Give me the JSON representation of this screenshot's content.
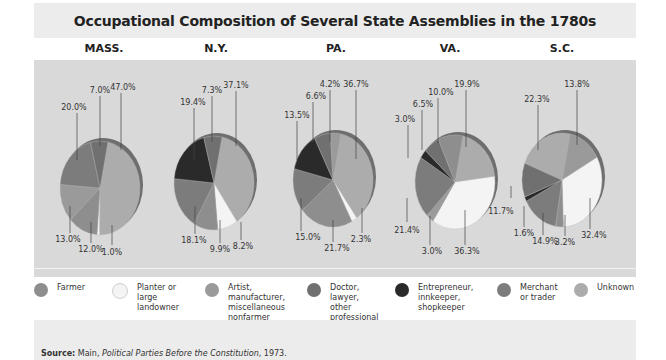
{
  "title": "Occupational Composition of Several State Assemblies in the 1780s",
  "source": {
    "label": "Source:",
    "author": "Main,",
    "work": "Political Parties Before the Constitution",
    "year": ", 1973."
  },
  "colors": {
    "Farmer": "#8e8e8e",
    "Planter": "#f4f4f4",
    "Artist": "#9a9a9a",
    "Doctor": "#707070",
    "Entrepreneur": "#2a2a2a",
    "Merchant": "#7c7c7c",
    "Unknown": "#acacac"
  },
  "legend": [
    {
      "key": "Farmer",
      "label": "Farmer"
    },
    {
      "key": "Planter",
      "label": "Planter or\nlarge\nlandowner"
    },
    {
      "key": "Artist",
      "label": "Artist,\nmanufacturer,\nmiscellaneous\nnonfarmer"
    },
    {
      "key": "Doctor",
      "label": "Doctor,\nlawyer,\nother\nprofessional"
    },
    {
      "key": "Entrepreneur",
      "label": "Entrepreneur,\ninnkeeper,\nshopkeeper"
    },
    {
      "key": "Merchant",
      "label": "Merchant\nor trader"
    },
    {
      "key": "Unknown",
      "label": "Unknown"
    }
  ],
  "chart_data": {
    "type": "pie",
    "title": "Occupational Composition of Several State Assemblies in the 1780s",
    "categories": [
      "Farmer",
      "Planter or large landowner",
      "Artist, manufacturer, miscellaneous nonfarmer",
      "Doctor, lawyer, other professional",
      "Entrepreneur, innkeeper, shopkeeper",
      "Merchant or trader",
      "Unknown"
    ],
    "legend_position": "bottom",
    "source": "Main, Political Parties Before the Constitution, 1973.",
    "pies": [
      {
        "state": "MASS.",
        "slices": [
          {
            "key": "Unknown",
            "value": 47.0
          },
          {
            "key": "Planter",
            "value": 1.0
          },
          {
            "key": "Farmer",
            "value": 12.0
          },
          {
            "key": "Artist",
            "value": 13.0
          },
          {
            "key": "Merchant",
            "value": 20.0
          },
          {
            "key": "Doctor",
            "value": 7.0
          }
        ]
      },
      {
        "state": "N.Y.",
        "slices": [
          {
            "key": "Unknown",
            "value": 37.1
          },
          {
            "key": "Planter",
            "value": 8.2
          },
          {
            "key": "Farmer",
            "value": 9.9
          },
          {
            "key": "Merchant",
            "value": 18.1
          },
          {
            "key": "Entrepreneur",
            "value": 19.4
          },
          {
            "key": "Doctor",
            "value": 7.3
          }
        ]
      },
      {
        "state": "PA.",
        "slices": [
          {
            "key": "Unknown",
            "value": 36.7
          },
          {
            "key": "Planter",
            "value": 2.3
          },
          {
            "key": "Farmer",
            "value": 21.7
          },
          {
            "key": "Merchant",
            "value": 15.0
          },
          {
            "key": "Entrepreneur",
            "value": 13.5
          },
          {
            "key": "Doctor",
            "value": 6.6
          },
          {
            "key": "Artist",
            "value": 4.2
          }
        ]
      },
      {
        "state": "VA.",
        "slices": [
          {
            "key": "Unknown",
            "value": 19.9
          },
          {
            "key": "Planter",
            "value": 36.3
          },
          {
            "key": "Artist",
            "value": 3.0
          },
          {
            "key": "Merchant",
            "value": 21.4
          },
          {
            "key": "Entrepreneur",
            "value": 3.0
          },
          {
            "key": "Doctor",
            "value": 6.5
          },
          {
            "key": "Farmer",
            "value": 10.0
          }
        ]
      },
      {
        "state": "S.C.",
        "slices": [
          {
            "key": "Artist",
            "value": 13.8
          },
          {
            "key": "Planter",
            "value": 32.4
          },
          {
            "key": "Farmer",
            "value": 3.2
          },
          {
            "key": "Merchant",
            "value": 14.9
          },
          {
            "key": "Entrepreneur",
            "value": 1.6
          },
          {
            "key": "Doctor",
            "value": 11.7
          },
          {
            "key": "Unknown",
            "value": 22.3
          }
        ]
      }
    ]
  },
  "layout": {
    "pies": [
      {
        "cx": 100,
        "cy": 188,
        "label_x": 97,
        "labels": [
          {
            "text": "47.0%",
            "x": 123,
            "y": 90,
            "lx": 121,
            "ly1": 93,
            "ly2": 150
          },
          {
            "text": "1.0%",
            "x": 112,
            "y": 255,
            "lx": 112,
            "ly1": 245,
            "ly2": 225
          },
          {
            "text": "12.0%",
            "x": 91,
            "y": 252,
            "lx": 91,
            "ly1": 243,
            "ly2": 222
          },
          {
            "text": "13.0%",
            "x": 68,
            "y": 242,
            "lx": 70,
            "ly1": 233,
            "ly2": 206
          },
          {
            "text": "20.0%",
            "x": 74,
            "y": 110,
            "lx": 77,
            "ly1": 113,
            "ly2": 160
          },
          {
            "text": "7.0%",
            "x": 100,
            "y": 93,
            "lx": 100,
            "ly1": 96,
            "ly2": 146
          }
        ]
      },
      {
        "cx": 214,
        "cy": 183,
        "labels": [
          {
            "text": "37.1%",
            "x": 236,
            "y": 88,
            "lx": 236,
            "ly1": 91,
            "ly2": 146
          },
          {
            "text": "8.2%",
            "x": 243,
            "y": 249,
            "lx": 241,
            "ly1": 240,
            "ly2": 222
          },
          {
            "text": "9.9%",
            "x": 220,
            "y": 252,
            "lx": 220,
            "ly1": 243,
            "ly2": 220
          },
          {
            "text": "18.1%",
            "x": 194,
            "y": 243,
            "lx": 195,
            "ly1": 234,
            "ly2": 206
          },
          {
            "text": "19.4%",
            "x": 193,
            "y": 105,
            "lx": 194,
            "ly1": 108,
            "ly2": 160
          },
          {
            "text": "7.3%",
            "x": 212,
            "y": 93,
            "lx": 212,
            "ly1": 96,
            "ly2": 142
          }
        ]
      },
      {
        "cx": 333,
        "cy": 180,
        "labels": [
          {
            "text": "36.7%",
            "x": 356,
            "y": 87,
            "lx": 356,
            "ly1": 90,
            "ly2": 159
          },
          {
            "text": "2.3%",
            "x": 361,
            "y": 242,
            "lx": 362,
            "ly1": 233,
            "ly2": 208
          },
          {
            "text": "21.7%",
            "x": 337,
            "y": 251,
            "lx": 333,
            "ly1": 242,
            "ly2": 220
          },
          {
            "text": "15.0%",
            "x": 308,
            "y": 240,
            "lx": 301,
            "ly1": 231,
            "ly2": 198
          },
          {
            "text": "13.5%",
            "x": 297,
            "y": 118,
            "lx": 297,
            "ly1": 121,
            "ly2": 160
          },
          {
            "text": "6.6%",
            "x": 316,
            "y": 99,
            "lx": 313,
            "ly1": 102,
            "ly2": 142
          },
          {
            "text": "4.2%",
            "x": 330,
            "y": 87,
            "lx": 330,
            "ly1": 90,
            "ly2": 142
          }
        ]
      },
      {
        "cx": 455,
        "cy": 182,
        "labels": [
          {
            "text": "19.9%",
            "x": 467,
            "y": 87,
            "lx": 466,
            "ly1": 90,
            "ly2": 147
          },
          {
            "text": "36.3%",
            "x": 467,
            "y": 254,
            "lx": 465,
            "ly1": 245,
            "ly2": 210
          },
          {
            "text": "3.0%",
            "x": 432,
            "y": 254,
            "lx": 430,
            "ly1": 245,
            "ly2": 216
          },
          {
            "text": "21.4%",
            "x": 407,
            "y": 233,
            "lx": 407,
            "ly1": 222,
            "ly2": 198
          },
          {
            "text": "3.0%",
            "x": 405,
            "y": 122,
            "lx": 408,
            "ly1": 125,
            "ly2": 158
          },
          {
            "text": "6.5%",
            "x": 423,
            "y": 107,
            "lx": 422,
            "ly1": 110,
            "ly2": 150
          },
          {
            "text": "10.0%",
            "x": 441,
            "y": 95,
            "lx": 438,
            "ly1": 98,
            "ly2": 143
          }
        ]
      },
      {
        "cx": 562,
        "cy": 180,
        "labels": [
          {
            "text": "13.8%",
            "x": 577,
            "y": 87,
            "lx": 577,
            "ly1": 90,
            "ly2": 145
          },
          {
            "text": "32.4%",
            "x": 594,
            "y": 238,
            "lx": 590,
            "ly1": 229,
            "ly2": 198
          },
          {
            "text": "3.2%",
            "x": 565,
            "y": 245,
            "lx": 565,
            "ly1": 236,
            "ly2": 215
          },
          {
            "text": "14.9%",
            "x": 545,
            "y": 244,
            "lx": 543,
            "ly1": 235,
            "ly2": 213
          },
          {
            "text": "1.6%",
            "x": 524,
            "y": 236,
            "lx": 524,
            "ly1": 227,
            "ly2": 206
          },
          {
            "text": "11.7%",
            "x": 501,
            "y": 214,
            "lx": 511,
            "ly1": 198,
            "ly2": 186
          },
          {
            "text": "22.3%",
            "x": 537,
            "y": 102,
            "lx": 538,
            "ly1": 105,
            "ly2": 150
          }
        ]
      }
    ],
    "state_x": [
      104,
      216,
      336,
      450,
      562
    ],
    "legend_x": [
      34,
      112,
      205,
      307,
      395,
      497,
      574
    ]
  }
}
